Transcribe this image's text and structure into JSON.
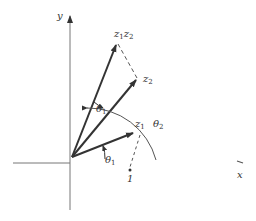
{
  "diagram": {
    "title": "",
    "axes": {
      "x_label": "x",
      "y_label": "y"
    },
    "vectors": [
      {
        "name": "z1",
        "label": "z",
        "sub": "1"
      },
      {
        "name": "z2",
        "label": "z",
        "sub": "2"
      },
      {
        "name": "z1z2",
        "label_parts": [
          "z",
          "1",
          "z",
          "2"
        ]
      }
    ],
    "angles": [
      {
        "name": "theta1-between-z2-and-z1z2",
        "label": "θ",
        "sub": "1"
      },
      {
        "name": "theta1-from-x-axis",
        "label": "θ",
        "sub": "1"
      },
      {
        "name": "theta2-from-x-axis",
        "label": "θ",
        "sub": "2"
      }
    ],
    "points": [
      {
        "name": "one-point",
        "label": "1"
      }
    ],
    "colors": {
      "lines": "#333333",
      "axes": "#666666"
    }
  }
}
